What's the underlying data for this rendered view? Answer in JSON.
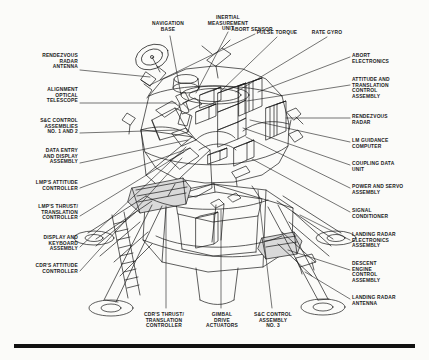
{
  "figure": {
    "background_color": "#fbfbf9",
    "line_color": "#1a1a1a",
    "text_color": "#1a1a1a",
    "divider_color": "#111111"
  },
  "callouts": {
    "top": [
      {
        "id": "abort-sensor",
        "text": "ABORT SENSOR",
        "align": "c",
        "x": 252,
        "y": 27,
        "anchor_x": 150,
        "anchor_y": 85
      },
      {
        "id": "navigation-base",
        "text": "NAVIGATION\nBASE",
        "align": "c",
        "x": 168,
        "y": 21,
        "anchor_x": 181,
        "anchor_y": 95
      },
      {
        "id": "inertial-measurement-unit",
        "text": "INERTIAL\nMEASUREMENT\nUNIT",
        "align": "c",
        "x": 228,
        "y": 15,
        "anchor_x": 196,
        "anchor_y": 93
      },
      {
        "id": "pulse-torque",
        "text": "PULSE TORQUE",
        "align": "c",
        "x": 277,
        "y": 30,
        "anchor_x": 221,
        "anchor_y": 91
      },
      {
        "id": "rate-gyro",
        "text": "RATE GYRO",
        "align": "c",
        "x": 327,
        "y": 30,
        "anchor_x": 236,
        "anchor_y": 92
      }
    ],
    "left": [
      {
        "id": "rendezvous-radar-antenna",
        "text": "RENDEZVOUS\nRADAR\nANTENNA",
        "x": 78,
        "y": 53,
        "anchor_x": 150,
        "anchor_y": 77
      },
      {
        "id": "alignment-optical-telescope",
        "text": "ALIGNMENT\nOPTICAL\nTELESCOPE",
        "x": 78,
        "y": 87,
        "anchor_x": 176,
        "anchor_y": 103
      },
      {
        "id": "sc-control-assemblies-1-2",
        "text": "S&C CONTROL\nASSEMBLIES\nNO. 1 AND 2",
        "x": 78,
        "y": 118,
        "anchor_x": 178,
        "anchor_y": 130
      },
      {
        "id": "data-entry-display-assembly",
        "text": "DATA ENTRY\nAND DISPLAY\nASSEMBLY",
        "x": 78,
        "y": 148,
        "anchor_x": 188,
        "anchor_y": 140
      },
      {
        "id": "lmps-attitude-controller",
        "text": "LMP'S ATTITUDE\nCONTROLLER",
        "x": 78,
        "y": 180,
        "anchor_x": 190,
        "anchor_y": 148
      },
      {
        "id": "lmps-thrust-translation-controller",
        "text": "LMP'S THRUST/\nTRANSLATION\nCONTROLLER",
        "x": 78,
        "y": 204,
        "anchor_x": 184,
        "anchor_y": 152
      },
      {
        "id": "display-keyboard-assembly",
        "text": "DISPLAY AND\nKEYBOARD\nASSEMBLY",
        "x": 78,
        "y": 235,
        "anchor_x": 186,
        "anchor_y": 147
      },
      {
        "id": "cdrs-attitude-controller",
        "text": "CDR'S ATTITUDE\nCONTROLLER",
        "x": 78,
        "y": 263,
        "anchor_x": 182,
        "anchor_y": 158
      }
    ],
    "right": [
      {
        "id": "abort-electronics",
        "text": "ABORT\nELECTRONICS",
        "x": 352,
        "y": 53,
        "anchor_x": 258,
        "anchor_y": 92
      },
      {
        "id": "attitude-translation-control-assembly",
        "text": "ATTITUDE AND\nTRANSLATION\nCONTROL\nASSEMBLY",
        "x": 352,
        "y": 77,
        "anchor_x": 247,
        "anchor_y": 101
      },
      {
        "id": "rendezvous-radar",
        "text": "RENDEZVOUS\nRADAR",
        "x": 352,
        "y": 114,
        "anchor_x": 286,
        "anchor_y": 118
      },
      {
        "id": "lm-guidance-computer",
        "text": "LM GUIDANCE\nCOMPUTER",
        "x": 352,
        "y": 138,
        "anchor_x": 250,
        "anchor_y": 120
      },
      {
        "id": "coupling-data-unit",
        "text": "COUPLING DATA\nUNIT",
        "x": 352,
        "y": 161,
        "anchor_x": 243,
        "anchor_y": 128
      },
      {
        "id": "power-and-servo-assembly",
        "text": "POWER AND SERVO\nASSEMBLY",
        "x": 352,
        "y": 184,
        "anchor_x": 246,
        "anchor_y": 137
      },
      {
        "id": "signal-conditioner",
        "text": "SIGNAL\nCONDITIONER",
        "x": 352,
        "y": 208,
        "anchor_x": 252,
        "anchor_y": 159
      },
      {
        "id": "landing-radar-electronics-assembly",
        "text": "LANDING RADAR\nELECTRONICS\nASSEMBLY",
        "x": 352,
        "y": 232,
        "anchor_x": 300,
        "anchor_y": 215
      },
      {
        "id": "descent-engine-control-assembly",
        "text": "DESCENT\nENGINE\nCONTROL\nASSEMBLY",
        "x": 352,
        "y": 261,
        "anchor_x": 288,
        "anchor_y": 250
      },
      {
        "id": "landing-radar-antenna",
        "text": "LANDING RADAR\nANTENNA",
        "x": 352,
        "y": 295,
        "anchor_x": 305,
        "anchor_y": 272
      }
    ],
    "bottom": [
      {
        "id": "cdrs-thrust-translation-controller",
        "text": "CDR'S THRUST/\nTRANSLATION\nCONTROLLER",
        "x": 164,
        "y": 312,
        "anchor_x": 166,
        "anchor_y": 206
      },
      {
        "id": "gimbal-drive-actuators",
        "text": "GIMBAL\nDRIVE\nACTUATORS",
        "x": 222,
        "y": 312,
        "anchor_x": 221,
        "anchor_y": 210
      },
      {
        "id": "sc-control-assembly-3",
        "text": "S&C CONTROL\nASSEMBLY\nNO. 3",
        "x": 272,
        "y": 312,
        "anchor_x": 258,
        "anchor_y": 190
      }
    ]
  }
}
